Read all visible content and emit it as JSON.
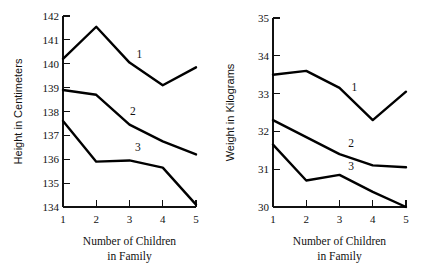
{
  "chart_data": [
    {
      "type": "line",
      "title": "",
      "xlabel": "Number of Children in Family",
      "xlabel_line1": "Number of Children",
      "xlabel_line2": "in Family",
      "ylabel": "Height in Centimeters",
      "x": [
        1,
        2,
        3,
        4,
        5
      ],
      "xticklabels": [
        "1",
        "2",
        "3",
        "4",
        "5"
      ],
      "yticklabels": [
        "134",
        "135",
        "136",
        "137",
        "138",
        "139",
        "140",
        "141",
        "142"
      ],
      "yticks": [
        134,
        135,
        136,
        137,
        138,
        139,
        140,
        141,
        142
      ],
      "xlim": [
        1,
        5
      ],
      "ylim": [
        134,
        142
      ],
      "grid": false,
      "legend": "inline-series-labels",
      "series": [
        {
          "name": "1",
          "label": "1",
          "values": [
            140.2,
            141.55,
            140.05,
            139.1,
            139.85
          ]
        },
        {
          "name": "2",
          "label": "2",
          "values": [
            138.9,
            138.7,
            137.45,
            136.75,
            136.2
          ]
        },
        {
          "name": "3",
          "label": "3",
          "values": [
            137.6,
            135.9,
            135.95,
            135.65,
            134.1
          ]
        }
      ]
    },
    {
      "type": "line",
      "title": "",
      "xlabel": "Number of Children in Family",
      "xlabel_line1": "Number of Children",
      "xlabel_line2": "in Family",
      "ylabel": "Weight in Kilograms",
      "x": [
        1,
        2,
        3,
        4,
        5
      ],
      "xticklabels": [
        "1",
        "2",
        "3",
        "4",
        "5"
      ],
      "yticklabels": [
        "30",
        "31",
        "32",
        "33",
        "34",
        "35"
      ],
      "yticks": [
        30,
        31,
        32,
        33,
        34,
        35
      ],
      "xlim": [
        1,
        5
      ],
      "ylim": [
        30,
        35
      ],
      "grid": false,
      "legend": "inline-series-labels",
      "series": [
        {
          "name": "1",
          "label": "1",
          "values": [
            33.5,
            33.6,
            33.15,
            32.3,
            33.05
          ]
        },
        {
          "name": "2",
          "label": "2",
          "values": [
            32.3,
            31.85,
            31.4,
            31.1,
            31.05
          ]
        },
        {
          "name": "3",
          "label": "3",
          "values": [
            31.65,
            30.7,
            30.85,
            30.4,
            30.0
          ]
        }
      ]
    }
  ],
  "colors": {
    "line": "#000000",
    "axis": "#111111",
    "text": "#111111",
    "background": "#ffffff"
  }
}
